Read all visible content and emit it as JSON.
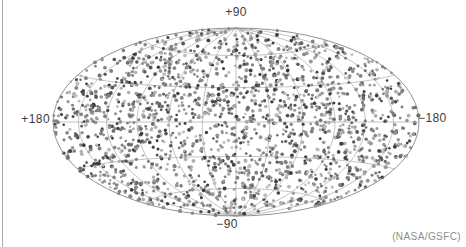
{
  "map": {
    "top_label": "+90",
    "bottom_label": "−90",
    "left_label": "+180",
    "right_label": "−180",
    "credit": "(NASA/GSFC)"
  },
  "chart_data": {
    "type": "scatter",
    "projection": "hammer-aitoff",
    "axis_labels": {
      "top": "+90",
      "bottom": "−90",
      "left": "+180",
      "right": "−180"
    },
    "credit": "(NASA/GSFC)",
    "grid": {
      "show": true,
      "meridian_step_deg": 30,
      "parallel_step_deg": 30,
      "color": "#9a9a9a",
      "outline_color": "#878787",
      "line_width": 0.6,
      "outline_width": 0.9
    },
    "points": {
      "count": 2000,
      "distribution": "isotropic-random",
      "seed": 7,
      "radius_px_min": 1.2,
      "radius_px_max": 2.0,
      "opacity": 0.88,
      "palette": [
        "#262626",
        "#3f3f3f",
        "#585858",
        "#717171",
        "#8a8a8a",
        "#a3a3a3",
        "#8a8a8a",
        "#717171",
        "#b5b5b5"
      ]
    },
    "background": "#ffffff"
  }
}
